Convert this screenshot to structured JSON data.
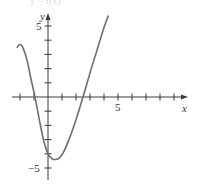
{
  "chart_data": {
    "type": "line",
    "title": "y = f(x)",
    "xlabel": "x",
    "ylabel": "y",
    "xlim": [
      -2.5,
      9.8
    ],
    "ylim": [
      -5.7,
      5.8
    ],
    "grid": false,
    "legend": null,
    "x_tick_values": [
      -2,
      -1,
      1,
      2,
      3,
      4,
      5,
      6,
      7,
      8,
      9
    ],
    "y_tick_values": [
      -5,
      -4,
      -3,
      -2,
      -1,
      1,
      2,
      3,
      4,
      5
    ],
    "x_tick_labels": [
      {
        "value": 5,
        "label": "5"
      }
    ],
    "y_tick_labels": [
      {
        "value": 5,
        "label": "5"
      },
      {
        "value": -5,
        "label": "−5"
      }
    ],
    "series": [
      {
        "name": "f(x)",
        "color": "#6e6e6e",
        "x": [
          -2.2,
          -2.0,
          -1.8,
          -1.5,
          -1.2,
          -0.93,
          -0.6,
          -0.3,
          0.0,
          0.3,
          0.55,
          0.8,
          1.1,
          1.5,
          2.0,
          2.5,
          3.0,
          3.5,
          4.0,
          4.3
        ],
        "y": [
          3.5,
          3.7,
          3.5,
          2.6,
          1.2,
          0.0,
          -1.7,
          -3.1,
          -4.0,
          -4.35,
          -4.4,
          -4.3,
          -3.9,
          -3.0,
          -1.6,
          0.0,
          1.7,
          3.3,
          4.9,
          5.7
        ]
      }
    ],
    "annotations": []
  },
  "labels": {
    "top_title": "y = f(x)",
    "x_axis_label": "x",
    "y_axis_label": "y",
    "x_tick_5": "5",
    "y_tick_5": "5",
    "y_tick_neg5": "−5"
  },
  "colors": {
    "axis": "#3a3a3a",
    "curve": "#6e6e6e",
    "background": "#ffffff"
  }
}
